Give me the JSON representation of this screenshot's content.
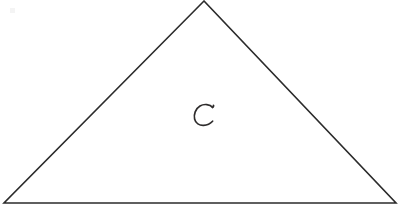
{
  "figure": {
    "kind": "geometry-diagram",
    "background_color": "#ffffff",
    "stroke_color": "#2b2b2b",
    "label_color": "#2e2c2c",
    "canvas": {
      "width": 408,
      "height": 209
    },
    "shape": {
      "name": "triangle",
      "type": "isosceles-triangle",
      "vertices": [
        {
          "name": "apex",
          "x": 204,
          "y": 1
        },
        {
          "name": "bottom-left",
          "x": 4,
          "y": 203
        },
        {
          "name": "bottom-right",
          "x": 396,
          "y": 203
        }
      ],
      "points_attr": "204,1 4,203 396,203",
      "stroke_width": 1.6,
      "filled": false
    },
    "labels": [
      {
        "id": "interior-label-c",
        "text": "C",
        "style": "handwritten",
        "x": 204,
        "y": 115,
        "width": 18,
        "height": 21
      }
    ],
    "alt_text": "Hand-drawn isosceles triangle with the handwritten letter C inside it"
  }
}
